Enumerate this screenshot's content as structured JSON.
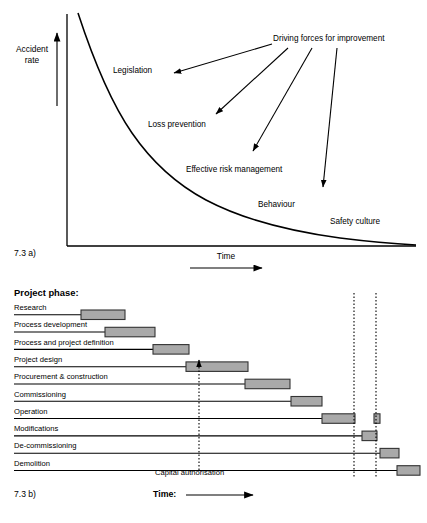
{
  "figure_a": {
    "caption": "7.3 a)",
    "y_axis_label_line1": "Accident",
    "y_axis_label_line2": "rate",
    "x_axis_label": "Time",
    "source_label": "Driving forces for improvement",
    "curve_labels": [
      {
        "text": "Legislation",
        "x": 113,
        "y": 66
      },
      {
        "text": "Loss prevention",
        "x": 148,
        "y": 121
      },
      {
        "text": "Effective risk management",
        "x": 186,
        "y": 167
      },
      {
        "text": "Behaviour",
        "x": 258,
        "y": 202
      },
      {
        "text": "Safety culture",
        "x": 328,
        "y": 220
      }
    ]
  },
  "chart_data": [
    {
      "type": "line",
      "title": "7.3 a) Accident rate versus Time",
      "xlabel": "Time",
      "ylabel": "Accident rate",
      "grid": false,
      "legend": "none",
      "annotations": [
        "Driving forces for improvement",
        "Legislation",
        "Loss prevention",
        "Effective risk management",
        "Behaviour",
        "Safety culture"
      ],
      "series": [
        {
          "name": "Accident rate",
          "x": [
            0,
            5,
            10,
            15,
            20,
            25,
            30,
            35,
            40,
            50,
            60,
            70,
            80,
            90,
            100
          ],
          "y": [
            100,
            74,
            56,
            44,
            35,
            28,
            23,
            19,
            16,
            12,
            9,
            7,
            5,
            3,
            1
          ]
        }
      ],
      "xlim": [
        0,
        100
      ],
      "ylim": [
        0,
        100
      ]
    },
    {
      "type": "bar",
      "orientation": "horizontal",
      "title": "7.3 b) Project phase versus Time",
      "xlabel": "Time:",
      "ylabel": "Project phase:",
      "grid": false,
      "legend": "none",
      "annotations": [
        "Capital authorisation"
      ],
      "categories": [
        "Research",
        "Process development",
        "Process and project definition",
        "Project design",
        "Procurement & construction",
        "Commissioning",
        "Operation",
        "Modifications",
        "De-commissioning",
        "Demolition"
      ],
      "bars": [
        {
          "label": "Research",
          "start": 4,
          "end": 17
        },
        {
          "label": "Process development",
          "start": 11,
          "end": 26
        },
        {
          "label": "Process and project definition",
          "start": 25,
          "end": 36
        },
        {
          "label": "Project design",
          "start": 35,
          "end": 53
        },
        {
          "label": "Procurement & construction",
          "start": 52,
          "end": 65
        },
        {
          "label": "Commissioning",
          "start": 65,
          "end": 74
        },
        {
          "label": "Operation",
          "start": 74,
          "end": 84
        },
        {
          "label": "Operation",
          "start": 90,
          "end": 92
        },
        {
          "label": "Modifications",
          "start": 86,
          "end": 90
        },
        {
          "label": "De-commissioning",
          "start": 92,
          "end": 98
        },
        {
          "label": "Demolition",
          "start": 97,
          "end": 104
        }
      ],
      "markers": [
        {
          "name": "capital-authorisation",
          "x": 35,
          "style": "dotted-up-arrow"
        },
        {
          "name": "divider-1",
          "x": 84,
          "style": "dotted"
        },
        {
          "name": "divider-2",
          "x": 90,
          "style": "dotted"
        }
      ]
    }
  ],
  "figure_b": {
    "caption": "7.3 b)",
    "heading": "Project phase:",
    "time_label": "Time:",
    "capital_authorisation": "Capital authorisation",
    "rows": [
      {
        "label": "Research",
        "leader_end": 81,
        "bar": [
          81,
          125
        ]
      },
      {
        "label": "Process development",
        "leader_end": 105,
        "bar": [
          105,
          155
        ]
      },
      {
        "label": "Process and project definition",
        "leader_end": 153,
        "bar": [
          153,
          189
        ]
      },
      {
        "label": "Project design",
        "leader_end": 186,
        "bar": [
          186,
          248
        ]
      },
      {
        "label": "Procurement & construction",
        "leader_end": 245,
        "bar": [
          245,
          290
        ]
      },
      {
        "label": "Commissioning",
        "leader_end": 291,
        "bar": [
          291,
          322
        ]
      },
      {
        "label": "Operation",
        "leader_end": 322,
        "bar": [
          322,
          355
        ],
        "bar2": [
          374,
          380
        ]
      },
      {
        "label": "Modifications",
        "leader_end": 362,
        "bar": [
          362,
          377
        ]
      },
      {
        "label": "De-commissioning",
        "leader_end": 380,
        "bar": [
          380,
          399
        ]
      },
      {
        "label": "Demolition",
        "leader_end": 397,
        "bar": [
          397,
          420
        ]
      }
    ]
  },
  "colors": {
    "bar_fill": "#a9a9a9",
    "bar_stroke": "#333333",
    "line": "#000000",
    "background": "#ffffff"
  }
}
